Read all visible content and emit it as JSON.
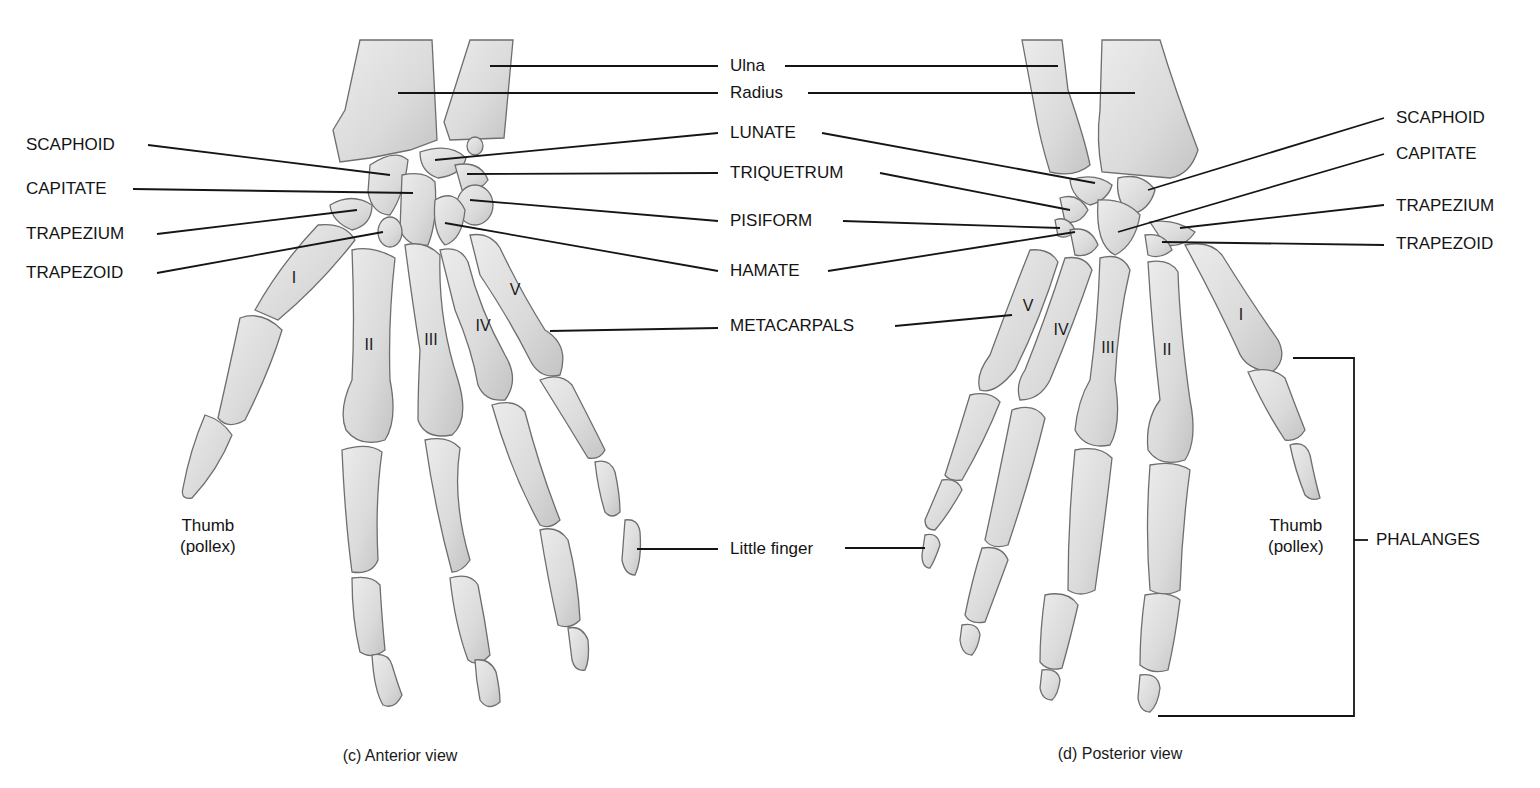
{
  "figure": {
    "colors": {
      "background": "#ffffff",
      "bone_fill": "#dcdcdc",
      "bone_outline": "#6e6e6e",
      "leader_line": "#151515",
      "text": "#141414"
    }
  },
  "panels": [
    {
      "id": "c",
      "caption": "(c) Anterior view"
    },
    {
      "id": "d",
      "caption": "(d) Posterior view"
    }
  ],
  "center_labels": {
    "ulna": "Ulna",
    "radius": "Radius",
    "lunate": "LUNATE",
    "triquetrum": "TRIQUETRUM",
    "pisiform": "PISIFORM",
    "hamate": "HAMATE",
    "metacarpals": "METACARPALS",
    "little_finger": "Little finger"
  },
  "left_labels": {
    "scaphoid": "SCAPHOID",
    "capitate": "CAPITATE",
    "trapezium": "TRAPEZIUM",
    "trapezoid": "TRAPEZOID",
    "thumb_line1": "Thumb",
    "thumb_line2": "(pollex)"
  },
  "right_labels": {
    "scaphoid": "SCAPHOID",
    "capitate": "CAPITATE",
    "trapezium": "TRAPEZIUM",
    "trapezoid": "TRAPEZOID",
    "thumb_line1": "Thumb",
    "thumb_line2": "(pollex)",
    "phalanges": "PHALANGES"
  },
  "metacarpal_numerals": {
    "anterior": [
      "I",
      "II",
      "III",
      "IV",
      "V"
    ],
    "posterior": [
      "V",
      "IV",
      "III",
      "II",
      "I"
    ]
  }
}
